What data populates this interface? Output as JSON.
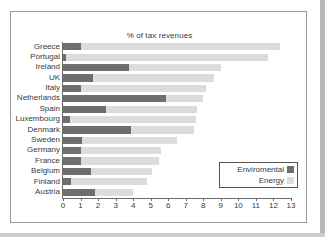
{
  "chart_data": {
    "type": "bar",
    "orientation": "horizontal",
    "stacked": true,
    "title": "% of tax revenues",
    "xlabel": "",
    "ylabel": "",
    "xlim": [
      0,
      13
    ],
    "xticks": [
      0,
      1,
      2,
      3,
      4,
      5,
      6,
      7,
      8,
      9,
      10,
      11,
      12,
      13
    ],
    "grid": false,
    "legend_position": "inside-bottom-right",
    "categories": [
      "Greece",
      "Portugal",
      "Ireland",
      "UK",
      "Italy",
      "Netherlands",
      "Spain",
      "Luxembourg",
      "Denmark",
      "Sweden",
      "Germany",
      "France",
      "Belgium",
      "Finland",
      "Austria"
    ],
    "series": [
      {
        "name": "Enviromental",
        "color": "#6e6e6e",
        "values": [
          1.05,
          0.15,
          3.75,
          1.7,
          1.05,
          5.9,
          2.45,
          0.4,
          3.85,
          1.1,
          1.05,
          1.05,
          1.6,
          0.45,
          1.8
        ]
      },
      {
        "name": "Energy",
        "color": "#dcdcdc",
        "values": [
          11.35,
          11.55,
          5.25,
          6.9,
          7.1,
          2.1,
          5.2,
          7.2,
          3.6,
          5.4,
          4.55,
          4.4,
          3.5,
          4.35,
          2.2
        ]
      }
    ],
    "totals": [
      12.4,
      11.7,
      9.0,
      8.6,
      8.15,
      8.0,
      7.65,
      7.6,
      7.45,
      6.5,
      5.6,
      5.45,
      5.1,
      4.8,
      4.0
    ]
  },
  "legend": {
    "items": [
      {
        "label": "Enviromental",
        "swatch": "#6e6e6e"
      },
      {
        "label": "Energy",
        "swatch": "#dcdcdc"
      }
    ]
  },
  "colors": {
    "environmental": "#6e6e6e",
    "energy": "#dcdcdc",
    "axis": "#6b6b6b",
    "text": "#3a3a3a",
    "frame": "#9a9a9a",
    "page": "#ffffff"
  }
}
